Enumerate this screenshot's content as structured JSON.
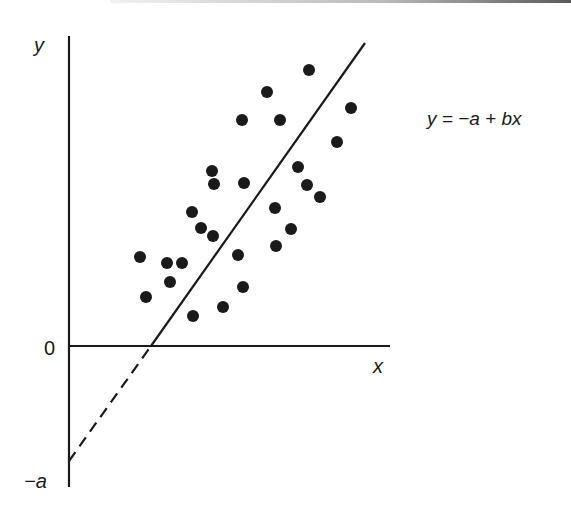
{
  "chart_data": {
    "type": "scatter",
    "title": "",
    "xlabel": "x",
    "ylabel": "y",
    "y_ticks": [
      "0",
      "−a"
    ],
    "annotation": "y = −a + bx",
    "grid": false,
    "legend": null,
    "fit_line": {
      "equation": "y = −a + bx",
      "solid_from": [
        8.2,
        0
      ],
      "solid_to": [
        29.6,
        30.3
      ],
      "dashed_from": [
        0,
        -11.5
      ],
      "dashed_to": [
        8.2,
        0
      ]
    },
    "points": [
      {
        "x": 24.0,
        "y": 27.6
      },
      {
        "x": 19.8,
        "y": 25.4
      },
      {
        "x": 21.1,
        "y": 22.6
      },
      {
        "x": 28.2,
        "y": 23.8
      },
      {
        "x": 26.8,
        "y": 20.4
      },
      {
        "x": 22.9,
        "y": 17.9
      },
      {
        "x": 23.8,
        "y": 16.1
      },
      {
        "x": 25.1,
        "y": 14.9
      },
      {
        "x": 17.3,
        "y": 22.6
      },
      {
        "x": 14.3,
        "y": 17.5
      },
      {
        "x": 14.5,
        "y": 16.2
      },
      {
        "x": 17.5,
        "y": 16.3
      },
      {
        "x": 20.6,
        "y": 13.8
      },
      {
        "x": 22.2,
        "y": 11.7
      },
      {
        "x": 20.7,
        "y": 10.0
      },
      {
        "x": 12.3,
        "y": 13.4
      },
      {
        "x": 13.2,
        "y": 11.8
      },
      {
        "x": 14.4,
        "y": 11.0
      },
      {
        "x": 7.1,
        "y": 8.9
      },
      {
        "x": 9.8,
        "y": 8.3
      },
      {
        "x": 11.3,
        "y": 8.3
      },
      {
        "x": 10.1,
        "y": 6.4
      },
      {
        "x": 7.7,
        "y": 4.9
      },
      {
        "x": 16.9,
        "y": 9.1
      },
      {
        "x": 17.4,
        "y": 5.9
      },
      {
        "x": 15.4,
        "y": 3.9
      },
      {
        "x": 12.4,
        "y": 3.0
      }
    ],
    "xlim": [
      0,
      32
    ],
    "ylim": [
      -14,
      31
    ]
  },
  "labels": {
    "y_axis": "y",
    "x_axis": "x",
    "zero": "0",
    "neg_a": "−a",
    "equation": "y = −a + bx"
  },
  "colors": {
    "ink": "#1a1a1a",
    "background": "#ffffff"
  }
}
